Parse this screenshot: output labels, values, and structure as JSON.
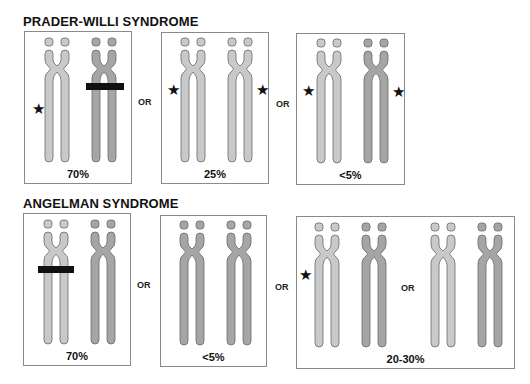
{
  "colors": {
    "maternal_fill": "#c9c9c9",
    "paternal_fill": "#a5a5a5",
    "outline": "#6a6a6a",
    "deletion_bar": "#111111",
    "box_border": "#8a8a8a"
  },
  "legend_symbols": {
    "star": "★",
    "star_meaning_icon": "imprinting-mark-icon",
    "bar_meaning_icon": "deletion-bar-icon"
  },
  "prader_willi": {
    "title": "PRADER-WILLI SYNDROME",
    "separator": "OR",
    "panels": [
      {
        "percent": "70%",
        "chromosomes": [
          "maternal",
          "paternal"
        ],
        "stars": [
          "left"
        ],
        "deletion_on": "paternal"
      },
      {
        "percent": "25%",
        "chromosomes": [
          "maternal",
          "maternal"
        ],
        "stars": [
          "left",
          "right"
        ],
        "deletion_on": null
      },
      {
        "percent": "<5%",
        "chromosomes": [
          "maternal",
          "paternal"
        ],
        "stars": [
          "left",
          "right"
        ],
        "deletion_on": null
      }
    ]
  },
  "angelman": {
    "title": "ANGELMAN SYNDROME",
    "separator": "OR",
    "panels": [
      {
        "percent": "70%",
        "chromosomes": [
          "maternal",
          "paternal"
        ],
        "stars": [],
        "deletion_on": "maternal"
      },
      {
        "percent": "<5%",
        "chromosomes": [
          "paternal",
          "paternal"
        ],
        "stars": [],
        "deletion_on": null
      },
      {
        "percent": "20-30%",
        "chromosomes": [
          "maternal",
          "paternal",
          "maternal",
          "paternal"
        ],
        "stars": [
          "left"
        ],
        "deletion_on": null,
        "inner_separator": "OR"
      }
    ]
  }
}
